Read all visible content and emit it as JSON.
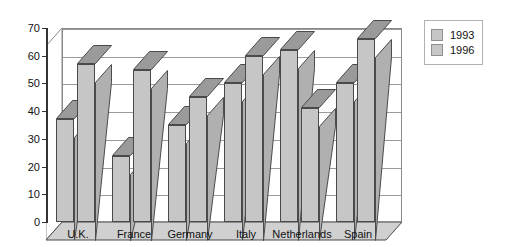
{
  "chart_data": {
    "type": "bar",
    "title": "",
    "subtitle": "",
    "xlabel": "",
    "ylabel": "",
    "categories": [
      "U.K.",
      "France",
      "Germany",
      "Italy",
      "Netherlands",
      "Spain"
    ],
    "series": [
      {
        "name": "1993",
        "values": [
          37,
          24,
          35,
          50,
          62,
          50
        ],
        "color": "#c6c6c6"
      },
      {
        "name": "1996",
        "values": [
          57,
          55,
          45,
          60,
          41,
          66
        ],
        "color": "#c6c6c6"
      }
    ],
    "ylim": [
      0,
      70
    ],
    "yticks": [
      0,
      10,
      20,
      30,
      40,
      50,
      60,
      70
    ],
    "ytick_labels": [
      "0",
      "10",
      "20",
      "30",
      "40",
      "50",
      "60",
      "70"
    ],
    "grid": true,
    "grid_axis": "y",
    "legend_position": "right",
    "style": "3d-column"
  },
  "legend": {
    "entries": [
      {
        "label": "1993"
      },
      {
        "label": "1996"
      }
    ]
  },
  "colors": {
    "bar_face": "#c6c6c6",
    "bar_top": "#9a9a9a",
    "bar_side": "#b0b0b0",
    "bar_outline": "#4a4a4a",
    "grid": "#9a9a9a",
    "axis": "#333333",
    "floor": "#d0d0d0",
    "background": "#ffffff",
    "text": "#111111"
  }
}
